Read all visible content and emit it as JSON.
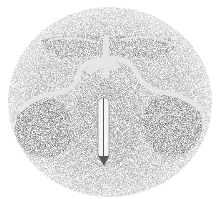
{
  "image": {
    "subject": "stippled anatomical illustration, roughly circular cross-section with central vertical cleft",
    "palette": {
      "background": "#ffffff",
      "stipple_dark": "#5a5a5a",
      "stipple_mid": "#8c8c8c",
      "stipple_light": "#bdbdbd",
      "highlight": "#f2f2f2"
    }
  }
}
